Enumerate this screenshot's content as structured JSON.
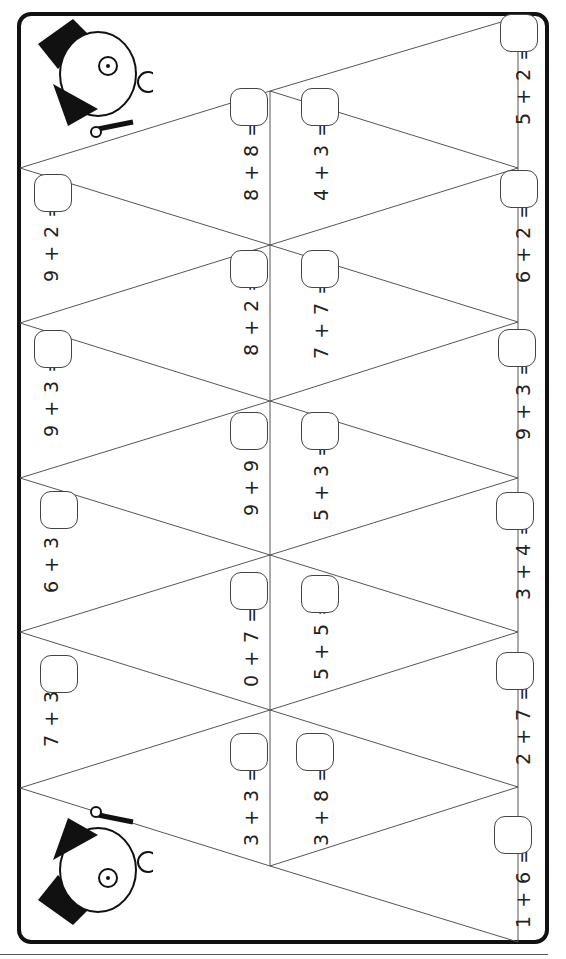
{
  "worksheet": {
    "type": "addition triangle puzzle",
    "line_color": "#555555",
    "frame_color": "#111111",
    "equations": [
      {
        "text": "9 + 2 =",
        "x": 52,
        "y": 282,
        "box": {
          "x": 34,
          "y": 174
        }
      },
      {
        "text": "9 + 3 =",
        "x": 52,
        "y": 437,
        "box": {
          "x": 34,
          "y": 330
        }
      },
      {
        "text": "6 + 3 =",
        "x": 52,
        "y": 593,
        "box": {
          "x": 40,
          "y": 491
        }
      },
      {
        "text": "7 + 3 =",
        "x": 52,
        "y": 747,
        "box": {
          "x": 40,
          "y": 655
        }
      },
      {
        "text": "8 + 8 =",
        "x": 252,
        "y": 201,
        "box": {
          "x": 230,
          "y": 88
        }
      },
      {
        "text": "8 + 2 =",
        "x": 252,
        "y": 356,
        "box": {
          "x": 230,
          "y": 250
        }
      },
      {
        "text": "9 + 9 =",
        "x": 252,
        "y": 516,
        "box": {
          "x": 230,
          "y": 412
        }
      },
      {
        "text": "0 + 7 =",
        "x": 252,
        "y": 687,
        "box": {
          "x": 230,
          "y": 572
        }
      },
      {
        "text": "3 + 3 =",
        "x": 252,
        "y": 846,
        "box": {
          "x": 230,
          "y": 733
        }
      },
      {
        "text": "4 + 3 =",
        "x": 322,
        "y": 201,
        "box": {
          "x": 301,
          "y": 88
        }
      },
      {
        "text": "7 + 7 =",
        "x": 322,
        "y": 359,
        "box": {
          "x": 301,
          "y": 250
        }
      },
      {
        "text": "5 + 3 =",
        "x": 322,
        "y": 521,
        "box": {
          "x": 301,
          "y": 412
        }
      },
      {
        "text": "5 + 5 =",
        "x": 322,
        "y": 680,
        "box": {
          "x": 301,
          "y": 575
        }
      },
      {
        "text": "3 + 8 =",
        "x": 322,
        "y": 846,
        "box": {
          "x": 296,
          "y": 733
        }
      },
      {
        "text": "5 + 2 =",
        "x": 524,
        "y": 125,
        "box": {
          "x": 500,
          "y": 14
        }
      },
      {
        "text": "6 + 2 =",
        "x": 524,
        "y": 283,
        "box": {
          "x": 500,
          "y": 170
        }
      },
      {
        "text": "9 + 3 =",
        "x": 524,
        "y": 440,
        "box": {
          "x": 498,
          "y": 329
        }
      },
      {
        "text": "3 + 4 =",
        "x": 524,
        "y": 600,
        "box": {
          "x": 496,
          "y": 492
        }
      },
      {
        "text": "2 + 7 =",
        "x": 524,
        "y": 765,
        "box": {
          "x": 496,
          "y": 652
        }
      },
      {
        "text": "1 + 6 =",
        "x": 524,
        "y": 928,
        "box": {
          "x": 494,
          "y": 816
        }
      }
    ],
    "illustrations": [
      {
        "name": "dog-top-hat-top",
        "x": 28,
        "y": 14
      },
      {
        "name": "dog-top-hat-bottom",
        "x": 28,
        "y": 790
      }
    ]
  }
}
